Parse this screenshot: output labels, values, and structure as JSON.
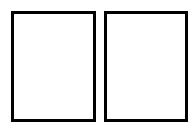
{
  "diagram": {
    "panels": [
      {
        "id": "left",
        "label": ""
      },
      {
        "id": "right",
        "label": ""
      }
    ],
    "border_color": "#000000",
    "fill_color": "#ffffff"
  }
}
